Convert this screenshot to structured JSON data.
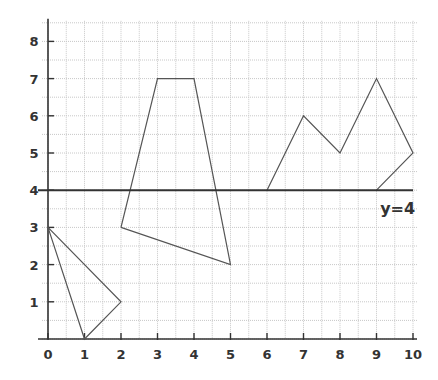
{
  "chart_data": {
    "type": "line",
    "title": "",
    "xlabel": "",
    "ylabel": "",
    "xlim": [
      0,
      10
    ],
    "ylim": [
      0,
      8.5
    ],
    "grid": true,
    "grid_step": 0.5,
    "x_ticks": [
      "0",
      "1",
      "2",
      "3",
      "4",
      "5",
      "6",
      "7",
      "8",
      "9",
      "10"
    ],
    "y_ticks": [
      "1",
      "2",
      "3",
      "4",
      "5",
      "6",
      "7",
      "8"
    ],
    "series": [
      {
        "name": "triangle",
        "points": [
          [
            0,
            3
          ],
          [
            2,
            1
          ],
          [
            1,
            0
          ],
          [
            0,
            3
          ]
        ]
      },
      {
        "name": "trapezoid-quadrilateral",
        "points": [
          [
            2,
            3
          ],
          [
            3,
            7
          ],
          [
            4,
            7
          ],
          [
            5,
            2
          ],
          [
            2,
            3
          ]
        ]
      },
      {
        "name": "zigzag-shape",
        "points": [
          [
            6,
            4
          ],
          [
            7,
            6
          ],
          [
            8,
            5
          ],
          [
            9,
            7
          ],
          [
            10,
            5
          ],
          [
            9,
            4
          ]
        ]
      }
    ],
    "reference_line": {
      "label": "y=4",
      "y": 4
    }
  }
}
